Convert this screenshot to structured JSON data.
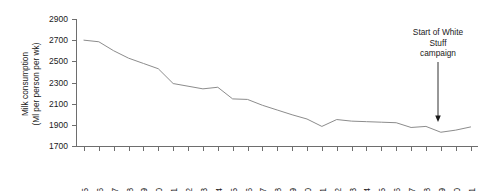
{
  "chart_data": {
    "type": "line",
    "title": "",
    "xlabel": "",
    "ylabel": "Milk consumption\n(Ml per person per wk)",
    "ylabel_line1": "Milk consumption",
    "ylabel_line2": "(Ml per person per wk)",
    "ylim": [
      1700,
      2900
    ],
    "ytick_labels": [
      "1700",
      "1900",
      "2100",
      "2300",
      "2500",
      "2700",
      "2900"
    ],
    "yticks": [
      1700,
      1900,
      2100,
      2300,
      2500,
      2700,
      2900
    ],
    "grid": false,
    "legend": "none",
    "categories": [
      "1975",
      "1976",
      "1977",
      "1978",
      "1979",
      "1980",
      "1981",
      "1982",
      "1983",
      "1984",
      "1985",
      "1986",
      "1987",
      "1988",
      "1989",
      "1990",
      "1991",
      "1992",
      "1993",
      "1994",
      "1995",
      "1996",
      "1997",
      "1998",
      "1999",
      "2000",
      "2001"
    ],
    "x": [
      1975,
      1976,
      1977,
      1978,
      1979,
      1980,
      1981,
      1982,
      1983,
      1984,
      1985,
      1986,
      1987,
      1988,
      1989,
      1990,
      1991,
      1992,
      1993,
      1994,
      1995,
      1996,
      1997,
      1998,
      1999,
      2000,
      2001
    ],
    "values": [
      2700,
      2685,
      2600,
      2530,
      2480,
      2430,
      2290,
      2265,
      2240,
      2255,
      2145,
      2140,
      2085,
      2040,
      1995,
      1955,
      1885,
      1950,
      1935,
      1930,
      1925,
      1920,
      1875,
      1885,
      1830,
      1850,
      1880
    ],
    "series": [
      {
        "name": "Milk consumption",
        "color": "#8c8c8c",
        "values": [
          2700,
          2685,
          2600,
          2530,
          2480,
          2430,
          2290,
          2265,
          2240,
          2255,
          2145,
          2140,
          2085,
          2040,
          1995,
          1955,
          1885,
          1950,
          1935,
          1930,
          1925,
          1920,
          1875,
          1885,
          1830,
          1850,
          1880
        ]
      }
    ],
    "annotations": [
      {
        "text": "Start of White Stuff campaign",
        "line1": "Start of White",
        "line2": "Stuff",
        "line3": "campaign",
        "target_x": 1999,
        "target_y": 1960,
        "arrow": "down-arrow"
      }
    ]
  }
}
